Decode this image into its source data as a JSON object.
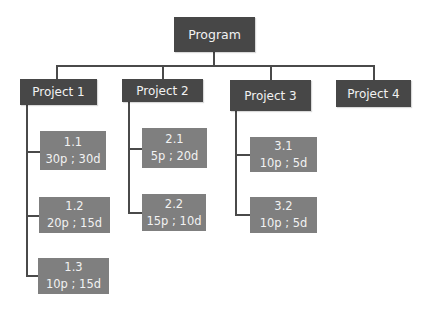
{
  "program": {
    "label": "Program"
  },
  "projects": [
    {
      "label": "Project 1",
      "tasks": [
        {
          "id": "1.1",
          "detail": "30p ; 30d"
        },
        {
          "id": "1.2",
          "detail": "20p ; 15d"
        },
        {
          "id": "1.3",
          "detail": "10p ; 15d"
        }
      ]
    },
    {
      "label": "Project 2",
      "tasks": [
        {
          "id": "2.1",
          "detail": "5p ; 20d"
        },
        {
          "id": "2.2",
          "detail": "15p ; 10d"
        }
      ]
    },
    {
      "label": "Project 3",
      "tasks": [
        {
          "id": "3.1",
          "detail": "10p ; 5d"
        },
        {
          "id": "3.2",
          "detail": "10p ; 5d"
        }
      ]
    },
    {
      "label": "Project 4",
      "tasks": []
    }
  ],
  "colors": {
    "program_box": "#474747",
    "project_box": "#474747",
    "task_box": "#7f7f7f",
    "connector": "#4a4a4a",
    "text": "#f2f2f2"
  }
}
